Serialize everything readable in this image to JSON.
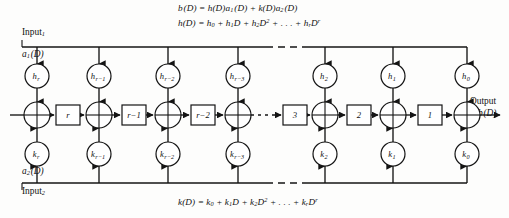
{
  "equations": {
    "output_relation": "b(D) = h(D)a1(D) + k(D)a2(D)",
    "h_polynomial": "h(D) = h0 + h1 D + h2 D^2 + . . . + hr D^r",
    "k_polynomial": "k(D) = k0 + k1 D + k2 D^2 + . . . + kr D^r"
  },
  "labels": {
    "input1": "Input",
    "input1_sub": "1",
    "input1_signal": "a",
    "input1_signal_sub": "1",
    "input1_signal_arg": "(D)",
    "input2": "Input",
    "input2_sub": "2",
    "input2_signal": "a",
    "input2_signal_sub": "2",
    "input2_signal_arg": "(D)",
    "output": "Output",
    "output_signal": "b",
    "output_signal_arg": "(D)",
    "ellipsis": ". . ."
  },
  "top_taps": [
    {
      "name": "h",
      "sub": "r",
      "x": 37
    },
    {
      "name": "h",
      "sub": "r−1",
      "x": 99
    },
    {
      "name": "h",
      "sub": "r−2",
      "x": 168
    },
    {
      "name": "h",
      "sub": "r−3",
      "x": 238
    },
    {
      "name": "h",
      "sub": "2",
      "x": 325
    },
    {
      "name": "h",
      "sub": "1",
      "x": 393
    },
    {
      "name": "h",
      "sub": "0",
      "x": 467
    }
  ],
  "bottom_taps": [
    {
      "name": "k",
      "sub": "r",
      "x": 37
    },
    {
      "name": "k",
      "sub": "r−1",
      "x": 99
    },
    {
      "name": "k",
      "sub": "r−2",
      "x": 168
    },
    {
      "name": "k",
      "sub": "r−3",
      "x": 238
    },
    {
      "name": "k",
      "sub": "2",
      "x": 325
    },
    {
      "name": "k",
      "sub": "1",
      "x": 393
    },
    {
      "name": "k",
      "sub": "0",
      "x": 467
    }
  ],
  "adders": [
    {
      "x": 37
    },
    {
      "x": 99
    },
    {
      "x": 168
    },
    {
      "x": 238
    },
    {
      "x": 325
    },
    {
      "x": 393
    },
    {
      "x": 467
    }
  ],
  "delay_boxes": [
    {
      "label": "r",
      "x": 68
    },
    {
      "label": "r−1",
      "x": 134
    },
    {
      "label": "r−2",
      "x": 203
    },
    {
      "label": "3",
      "x": 295
    },
    {
      "label": "2",
      "x": 359
    },
    {
      "label": "1",
      "x": 430
    }
  ],
  "geometry": {
    "top_bus_y": 47,
    "bottom_bus_y": 183,
    "tap_top_row_y": 76,
    "adder_row_y": 115,
    "tap_bottom_row_y": 154,
    "tap_radius": 12,
    "adder_radius": 13,
    "box_width": 24,
    "box_height": 20,
    "bus_left_x": 22,
    "bus_right_x": 467,
    "dash_gap_start": 266,
    "dash_gap_end": 306
  },
  "colors": {
    "stroke": "#141414",
    "background": "#fdfdfc",
    "fill": "#ffffff"
  }
}
